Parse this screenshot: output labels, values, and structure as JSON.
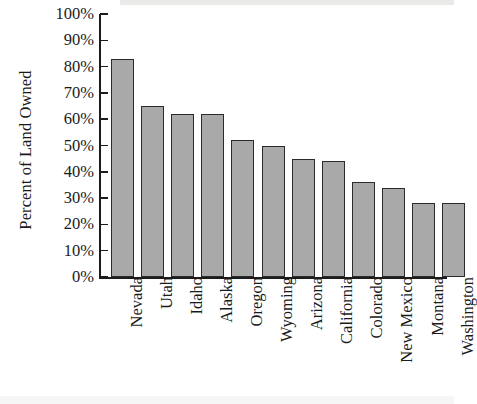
{
  "chart_data": {
    "type": "bar",
    "title": "",
    "xlabel": "",
    "ylabel": "Percent of Land Owned",
    "ylim": [
      0,
      100
    ],
    "ytick_labels": [
      "100%",
      "90%",
      "80%",
      "70%",
      "60%",
      "50%",
      "40%",
      "30%",
      "20%",
      "10%",
      "0%"
    ],
    "ytick_values": [
      100,
      90,
      80,
      70,
      60,
      50,
      40,
      30,
      20,
      10,
      0
    ],
    "grid": false,
    "legend": null,
    "categories": [
      "Nevada",
      "Utah",
      "Idaho",
      "Alaska",
      "Oregon",
      "Wyoming",
      "Arizona",
      "California",
      "Colorado",
      "New Mexico",
      "Montana",
      "Washington"
    ],
    "values": [
      83,
      65,
      62,
      62,
      52,
      50,
      45,
      44,
      36,
      34,
      28,
      28
    ],
    "bar_fill_color": "#a9a9a9",
    "bar_border_color": "#2b2b2b",
    "axis_color": "#1c1c1c"
  }
}
